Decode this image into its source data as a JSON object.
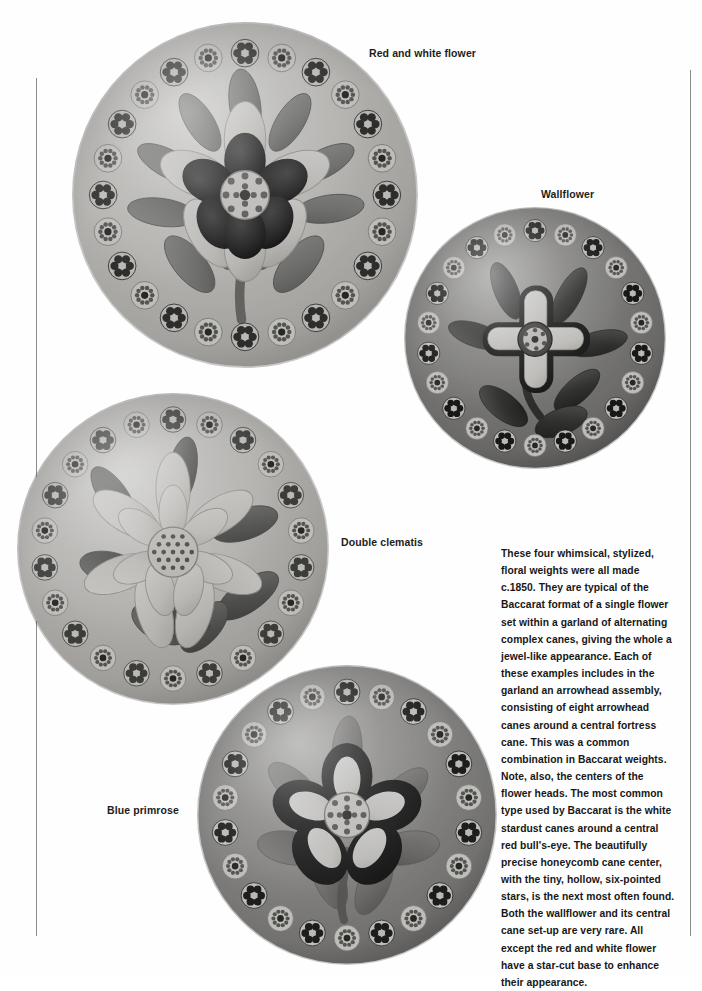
{
  "page": {
    "background_color": "#fefefe",
    "rule_color": "#8a8a8a"
  },
  "figures": [
    {
      "id": "pw-red-white",
      "caption": "Red and white flower",
      "subject": "glass paperweight",
      "ground_tone": "#e6e4e0",
      "petal_tone": "#f0eeea",
      "dark_petal_tone": "#2a2a2a",
      "leaf_tone": "#8d8d8d",
      "garland_canes": 24,
      "flower_petals": 6
    },
    {
      "id": "pw-wallflower",
      "caption": "Wallflower",
      "subject": "glass paperweight",
      "ground_tone": "#9c9c9a",
      "petal_tone": "#f2f1ee",
      "dark_petal_tone": "#1f1f1f",
      "leaf_tone": "#4a4a4a",
      "garland_canes": 22,
      "flower_petals": 5
    },
    {
      "id": "pw-clematis",
      "caption": "Double clematis",
      "subject": "glass paperweight",
      "ground_tone": "#e3e1dd",
      "petal_tone": "#ebe9e4",
      "dark_petal_tone": "#6d6d6d",
      "leaf_tone": "#6f6f6f",
      "garland_canes": 22,
      "flower_petals": 10
    },
    {
      "id": "pw-primrose",
      "caption": "Blue primrose",
      "subject": "glass paperweight",
      "ground_tone": "#a9a8a5",
      "petal_tone": "#f4f3f0",
      "dark_petal_tone": "#232323",
      "leaf_tone": "#8a8a88",
      "garland_canes": 22,
      "flower_petals": 5
    }
  ],
  "body_text": "These four whimsical, stylized, floral weights were all made c.1850. They are typical of the Baccarat format of a single flower set within a garland of alternating complex canes, giving the whole a jewel-like appearance. Each of these examples includes in the garland an arrowhead assembly, consisting of eight arrowhead canes around a central fortress cane. This was a common combination in Baccarat weights. Note, also, the centers of the flower heads. The most common type used by Baccarat is the white stardust canes around a central red bull's-eye. The beautifully precise honeycomb cane center, with the tiny, hollow, six-pointed stars, is the next most often found. Both the wallflower and its central cane set-up are very rare. All except the red and white flower have a star-cut base to enhance their appearance."
}
